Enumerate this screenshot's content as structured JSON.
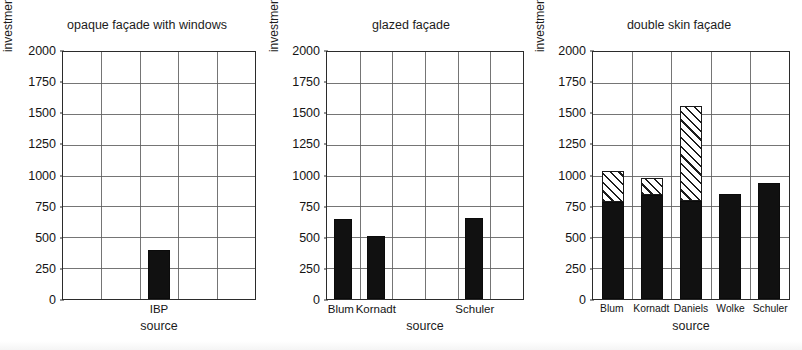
{
  "figure": {
    "ylabel": "investment costs [€/m² façade area]",
    "xlabel": "source",
    "yticks": [
      "2000",
      "1750",
      "1500",
      "1250",
      "1000",
      "750",
      "500",
      "250",
      "0"
    ],
    "legend_note": ""
  },
  "panels": [
    {
      "title": "opaque façade with windows"
    },
    {
      "title": "glazed façade"
    },
    {
      "title": "double skin façade"
    }
  ],
  "chart_data": [
    {
      "type": "bar",
      "title": "opaque façade with windows",
      "xlabel": "source",
      "ylabel": "investment costs [€/m² façade area]",
      "ylim": [
        0,
        2000
      ],
      "ytick_step": 250,
      "grid": true,
      "slots": 5,
      "bar_slot_indices": [
        2
      ],
      "categories": [
        "IBP"
      ],
      "values": [
        390
      ],
      "series": [
        {
          "name": "base costs",
          "style": "solid-black",
          "values": [
            390
          ]
        }
      ]
    },
    {
      "type": "bar",
      "title": "glazed façade",
      "xlabel": "source",
      "ylabel": "investment costs [€/m² façade area]",
      "ylim": [
        0,
        2000
      ],
      "ytick_step": 250,
      "grid": true,
      "slots": 6,
      "bar_slot_indices": [
        0,
        1,
        4
      ],
      "categories": [
        "Blum",
        "Kornadt",
        "Schuler"
      ],
      "values": [
        640,
        510,
        650
      ],
      "series": [
        {
          "name": "base costs",
          "style": "solid-black",
          "values": [
            640,
            510,
            650
          ]
        }
      ]
    },
    {
      "type": "stacked-bar",
      "title": "double skin façade",
      "xlabel": "source",
      "ylabel": "investment costs [€/m² façade area]",
      "ylim": [
        0,
        2000
      ],
      "ytick_step": 250,
      "grid": true,
      "slots": 5,
      "bar_slot_indices": [
        0,
        1,
        2,
        3,
        4
      ],
      "categories": [
        "Blum",
        "Kornadt",
        "Daniels",
        "Wolke",
        "Schuler"
      ],
      "totals": [
        1030,
        975,
        1550,
        840,
        935
      ],
      "series": [
        {
          "name": "base costs",
          "style": "solid-black",
          "values": [
            780,
            835,
            790,
            840,
            935
          ]
        },
        {
          "name": "additional range",
          "style": "hatched",
          "values": [
            250,
            140,
            760,
            0,
            0
          ]
        }
      ]
    }
  ],
  "colors": {
    "bar_solid": "#111111",
    "hatch_line": "#1d1d1d",
    "hatch_background": "#ffffff",
    "axis": "#2b2b2b",
    "grid": "#5d5d5d",
    "text": "#1a1a1a",
    "page_background": "#ffffff"
  }
}
